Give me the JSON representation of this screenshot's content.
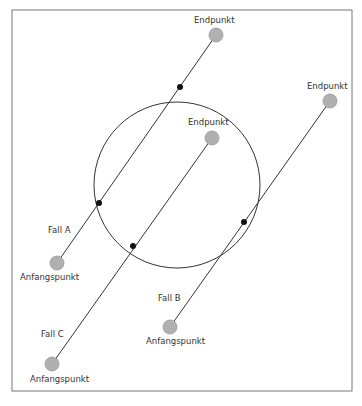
{
  "diagram": {
    "frame": {
      "x": 12,
      "y": 10,
      "width": 340,
      "height": 381,
      "stroke": "#777777"
    },
    "circle": {
      "cx": 177,
      "cy": 185,
      "r": 83,
      "stroke": "#333333"
    },
    "point_color": "#b0b0b0",
    "point_stroke": "#999999",
    "intersection_color": "#111111",
    "cases": [
      {
        "name": "Fall A",
        "label": "Fall A",
        "label_pos": {
          "x": 48,
          "y": 233
        },
        "start": {
          "x": 57,
          "y": 263,
          "label": "Anfangspunkt",
          "label_pos": {
            "x": 20,
            "y": 280
          }
        },
        "end": {
          "x": 216,
          "y": 35,
          "label": "Endpunkt",
          "label_pos": {
            "x": 194,
            "y": 23
          }
        },
        "intersections": [
          {
            "x": 180,
            "y": 87
          },
          {
            "x": 99,
            "y": 203
          }
        ]
      },
      {
        "name": "Fall B",
        "label": "Fall B",
        "label_pos": {
          "x": 158,
          "y": 301
        },
        "start": {
          "x": 170,
          "y": 327,
          "label": "Anfangspunkt",
          "label_pos": {
            "x": 146,
            "y": 344
          }
        },
        "end": {
          "x": 330,
          "y": 101,
          "label": "Endpunkt",
          "label_pos": {
            "x": 307,
            "y": 89
          }
        },
        "intersections": [
          {
            "x": 244,
            "y": 222
          }
        ]
      },
      {
        "name": "Fall C",
        "label": "Fall C",
        "label_pos": {
          "x": 41,
          "y": 337
        },
        "start": {
          "x": 52,
          "y": 364,
          "label": "Anfangspunkt",
          "label_pos": {
            "x": 30,
            "y": 382
          }
        },
        "end": {
          "x": 212,
          "y": 138,
          "label": "Endpunkt",
          "label_pos": {
            "x": 188,
            "y": 125
          }
        },
        "intersections": [
          {
            "x": 133,
            "y": 246
          }
        ]
      }
    ]
  }
}
